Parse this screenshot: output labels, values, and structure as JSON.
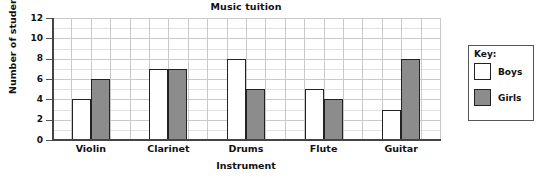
{
  "chart_data": {
    "type": "bar",
    "title": "Music tuition",
    "xlabel": "Instrument",
    "ylabel": "Number of students",
    "categories": [
      "Violin",
      "Clarinet",
      "Drums",
      "Flute",
      "Guitar"
    ],
    "series": [
      {
        "name": "Boys",
        "values": [
          4,
          7,
          8,
          5,
          3
        ],
        "color": "#ffffff"
      },
      {
        "name": "Girls",
        "values": [
          6,
          7,
          5,
          4,
          8
        ],
        "color": "#8c8c8c"
      }
    ],
    "ylim": [
      0,
      12
    ],
    "yticks": [
      0,
      2,
      4,
      6,
      8,
      10,
      12
    ],
    "ytick_labels": [
      "0",
      "2",
      "4",
      "6",
      "8",
      "10",
      "12"
    ],
    "grid": true,
    "legend_position": "right-outside",
    "legend_title": "Key:"
  }
}
